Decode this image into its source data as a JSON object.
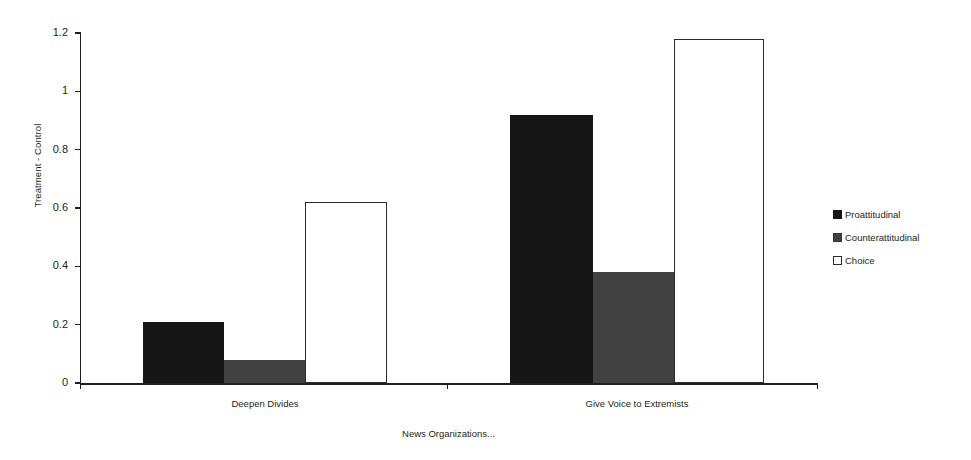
{
  "chart_data": {
    "type": "bar",
    "title": "",
    "xlabel": "News Organizations...",
    "ylabel": "Treatment - Control",
    "categories": [
      "Deepen Divides",
      "Give Voice to Extremists"
    ],
    "series": [
      {
        "name": "Proattitudinal",
        "color": "#161616",
        "values": [
          0.21,
          0.92
        ]
      },
      {
        "name": "Counterattitudinal",
        "color": "#414141",
        "values": [
          0.08,
          0.38
        ]
      },
      {
        "name": "Choice",
        "color": "#ffffff",
        "values": [
          0.62,
          1.18
        ]
      }
    ],
    "ylim": [
      0,
      1.2
    ],
    "ytick_labels": [
      "0",
      "0.2",
      "0.4",
      "0.6",
      "0.8",
      "1",
      "1.2"
    ],
    "ytick_values": [
      0,
      0.2,
      0.4,
      0.6,
      0.8,
      1,
      1.2
    ],
    "grid": false,
    "legend_position": "right"
  },
  "axes": {
    "y_title": "Treatment - Control",
    "x_title": "News Organizations...",
    "y_ticks": [
      {
        "label": "1.2",
        "value": 1.2
      },
      {
        "label": "1",
        "value": 1
      },
      {
        "label": "0.8",
        "value": 0.8
      },
      {
        "label": "0.6",
        "value": 0.6
      },
      {
        "label": "0.4",
        "value": 0.4
      },
      {
        "label": "0.2",
        "value": 0.2
      },
      {
        "label": "0",
        "value": 0
      }
    ],
    "x_categories": [
      {
        "label": "Deepen Divides"
      },
      {
        "label": "Give Voice to Extremists"
      }
    ]
  },
  "legend": {
    "items": [
      {
        "label": "Proattitudinal",
        "swatch": "proattitudinal"
      },
      {
        "label": "Counterattitudinal",
        "swatch": "counterattitudinal"
      },
      {
        "label": "Choice",
        "swatch": "choice"
      }
    ]
  },
  "plot_geometry": {
    "baseline_y": 383,
    "top_y": 33,
    "px_per_unit": 291.666,
    "axis_x": 80,
    "bars": [
      {
        "series": 0,
        "category": 0,
        "x": 143,
        "w": 81
      },
      {
        "series": 1,
        "category": 0,
        "x": 224,
        "w": 81
      },
      {
        "series": 2,
        "category": 0,
        "x": 305,
        "w": 82
      },
      {
        "series": 0,
        "category": 1,
        "x": 510,
        "w": 83
      },
      {
        "series": 1,
        "category": 1,
        "x": 593,
        "w": 81
      },
      {
        "series": 2,
        "category": 1,
        "x": 674,
        "w": 90
      }
    ],
    "x_ticks": [
      80,
      447,
      817
    ],
    "category_centers": [
      265,
      637
    ]
  }
}
